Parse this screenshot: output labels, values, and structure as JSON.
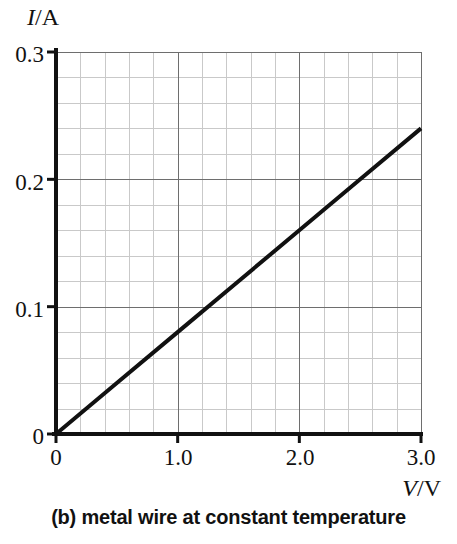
{
  "figure": {
    "caption": "(b) metal wire at constant temperature",
    "caption_label": "(b)"
  },
  "chart_data": {
    "type": "line",
    "title": "",
    "subtitle": "",
    "caption": "(b) metal wire at constant temperature",
    "xlabel": "V/V",
    "xlabel_symbol": "V",
    "xlabel_unit": "V",
    "ylabel": "I/A",
    "ylabel_symbol": "I",
    "ylabel_unit": "A",
    "xlim": [
      0,
      3.0
    ],
    "ylim": [
      0,
      0.3
    ],
    "xticks": [
      "0",
      "1.0",
      "2.0",
      "3.0"
    ],
    "xtick_values": [
      0,
      1.0,
      2.0,
      3.0
    ],
    "yticks": [
      "0",
      "0.1",
      "0.2",
      "0.3"
    ],
    "ytick_values": [
      0,
      0.1,
      0.2,
      0.3
    ],
    "grid": true,
    "grid_minor": true,
    "minor_divisions_x": 5,
    "minor_divisions_y": 5,
    "legend": null,
    "legend_position": "none",
    "series": [
      {
        "name": "metal wire at constant temperature",
        "x": [
          0,
          0.5,
          1.0,
          1.5,
          2.0,
          2.5,
          3.0
        ],
        "values": [
          0,
          0.04,
          0.08,
          0.12,
          0.16,
          0.2,
          0.24
        ],
        "slope": 0.08,
        "intercept": 0,
        "color": "#111111",
        "linewidth": 4
      }
    ],
    "annotations": []
  },
  "colors": {
    "line": "#111111",
    "axis": "#111111",
    "grid_major": "#6e6e6e",
    "grid_minor": "#c9c9c9",
    "background": "#ffffff",
    "text": "#111111"
  },
  "geometry": {
    "plot_left": 56,
    "plot_right": 421,
    "plot_top": 52,
    "plot_bottom": 434
  }
}
